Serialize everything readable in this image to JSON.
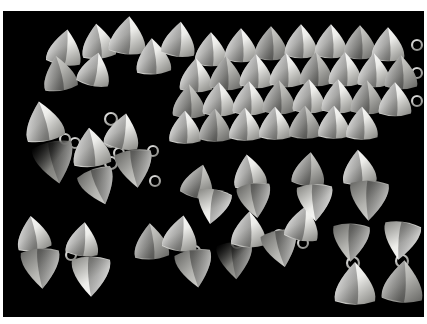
{
  "image": {
    "title": "Triangular metal jewelry components on black background",
    "medium": "photograph",
    "width": 427,
    "height": 324,
    "frame": {
      "border_color": "#ffffff",
      "border_top": 11,
      "border_left": 3,
      "border_right": 3,
      "border_bottom": 7
    },
    "background_color": "#000000",
    "subject": "polished triangular / conical silver-toned metal elements, some joined in pairs and chains by small jump rings",
    "palette": {
      "black": "#000000",
      "white": "#ffffff",
      "highlight": "#f2f2f0",
      "midtone": "#b9b9b5",
      "shadow": "#6e6e6b",
      "deep_shadow": "#3a3a38",
      "ring_metal": "#d8d8d4"
    }
  },
  "chart_data": {
    "type": "scatter",
    "title": "Triangular metal jewelry components on black background",
    "xlabel": "",
    "ylabel": "",
    "xlim": [
      0,
      421
    ],
    "ylim": [
      0,
      306
    ],
    "grid": false,
    "legend": null,
    "note": "Each datum is one triangular/conical metal element: x,y are centroid coordinates inside the black photo area, s is size in px, r is rotation in degrees, t is the tonal group, g is the grouping/cluster it belongs to.",
    "groups": [
      {
        "id": "scatter-top-left",
        "label": "loose scattered cones, upper left"
      },
      {
        "id": "grid-dense",
        "label": "dense packed grid, upper right"
      },
      {
        "id": "chain-left",
        "label": "linked chain, left side"
      },
      {
        "id": "chain-bottom",
        "label": "linked chain, lower middle"
      },
      {
        "id": "pairs-middle",
        "label": "hinged pairs, middle right"
      },
      {
        "id": "pairs-bottom-right",
        "label": "bowtie pairs, lower right"
      },
      {
        "id": "loose-bottom-left",
        "label": "loose pairs, lower left"
      }
    ],
    "points": [
      {
        "x": 62,
        "y": 36,
        "s": 34,
        "r": 8,
        "t": "highlight",
        "g": "scatter-top-left"
      },
      {
        "x": 95,
        "y": 30,
        "s": 33,
        "r": -6,
        "t": "highlight",
        "g": "scatter-top-left"
      },
      {
        "x": 125,
        "y": 24,
        "s": 36,
        "r": 4,
        "t": "highlight",
        "g": "scatter-top-left"
      },
      {
        "x": 56,
        "y": 62,
        "s": 33,
        "r": -10,
        "t": "midtone",
        "g": "scatter-top-left"
      },
      {
        "x": 92,
        "y": 58,
        "s": 32,
        "r": 12,
        "t": "highlight",
        "g": "scatter-top-left"
      },
      {
        "x": 150,
        "y": 45,
        "s": 34,
        "r": -4,
        "t": "highlight",
        "g": "scatter-top-left"
      },
      {
        "x": 176,
        "y": 28,
        "s": 33,
        "r": 6,
        "t": "highlight",
        "g": "scatter-top-left"
      },
      {
        "x": 208,
        "y": 38,
        "s": 32,
        "r": 0,
        "t": "highlight",
        "g": "grid-dense"
      },
      {
        "x": 238,
        "y": 34,
        "s": 32,
        "r": 0,
        "t": "highlight",
        "g": "grid-dense"
      },
      {
        "x": 268,
        "y": 32,
        "s": 32,
        "r": 0,
        "t": "midtone",
        "g": "grid-dense"
      },
      {
        "x": 298,
        "y": 30,
        "s": 32,
        "r": 0,
        "t": "highlight",
        "g": "grid-dense"
      },
      {
        "x": 328,
        "y": 30,
        "s": 32,
        "r": 0,
        "t": "highlight",
        "g": "grid-dense"
      },
      {
        "x": 357,
        "y": 31,
        "s": 32,
        "r": 0,
        "t": "midtone",
        "g": "grid-dense"
      },
      {
        "x": 385,
        "y": 33,
        "s": 32,
        "r": 0,
        "t": "highlight",
        "g": "grid-dense"
      },
      {
        "x": 193,
        "y": 64,
        "s": 32,
        "r": 0,
        "t": "highlight",
        "g": "grid-dense"
      },
      {
        "x": 223,
        "y": 62,
        "s": 32,
        "r": 0,
        "t": "midtone",
        "g": "grid-dense"
      },
      {
        "x": 253,
        "y": 60,
        "s": 32,
        "r": 0,
        "t": "highlight",
        "g": "grid-dense"
      },
      {
        "x": 283,
        "y": 59,
        "s": 32,
        "r": 0,
        "t": "highlight",
        "g": "grid-dense"
      },
      {
        "x": 313,
        "y": 58,
        "s": 32,
        "r": 0,
        "t": "midtone",
        "g": "grid-dense"
      },
      {
        "x": 342,
        "y": 58,
        "s": 32,
        "r": 0,
        "t": "highlight",
        "g": "grid-dense"
      },
      {
        "x": 371,
        "y": 59,
        "s": 32,
        "r": 0,
        "t": "highlight",
        "g": "grid-dense"
      },
      {
        "x": 398,
        "y": 61,
        "s": 32,
        "r": 0,
        "t": "midtone",
        "g": "grid-dense"
      },
      {
        "x": 186,
        "y": 90,
        "s": 32,
        "r": 0,
        "t": "midtone",
        "g": "grid-dense"
      },
      {
        "x": 216,
        "y": 88,
        "s": 32,
        "r": 0,
        "t": "highlight",
        "g": "grid-dense"
      },
      {
        "x": 246,
        "y": 87,
        "s": 32,
        "r": 0,
        "t": "highlight",
        "g": "grid-dense"
      },
      {
        "x": 276,
        "y": 86,
        "s": 32,
        "r": 0,
        "t": "midtone",
        "g": "grid-dense"
      },
      {
        "x": 306,
        "y": 85,
        "s": 32,
        "r": 0,
        "t": "highlight",
        "g": "grid-dense"
      },
      {
        "x": 335,
        "y": 85,
        "s": 32,
        "r": 0,
        "t": "highlight",
        "g": "grid-dense"
      },
      {
        "x": 364,
        "y": 86,
        "s": 32,
        "r": 0,
        "t": "midtone",
        "g": "grid-dense"
      },
      {
        "x": 392,
        "y": 88,
        "s": 32,
        "r": 0,
        "t": "highlight",
        "g": "grid-dense"
      },
      {
        "x": 182,
        "y": 116,
        "s": 31,
        "r": 0,
        "t": "highlight",
        "g": "grid-dense"
      },
      {
        "x": 212,
        "y": 114,
        "s": 31,
        "r": 0,
        "t": "midtone",
        "g": "grid-dense"
      },
      {
        "x": 242,
        "y": 113,
        "s": 31,
        "r": 0,
        "t": "highlight",
        "g": "grid-dense"
      },
      {
        "x": 272,
        "y": 112,
        "s": 31,
        "r": 0,
        "t": "highlight",
        "g": "grid-dense"
      },
      {
        "x": 302,
        "y": 111,
        "s": 31,
        "r": 0,
        "t": "midtone",
        "g": "grid-dense"
      },
      {
        "x": 331,
        "y": 111,
        "s": 31,
        "r": 0,
        "t": "highlight",
        "g": "grid-dense"
      },
      {
        "x": 359,
        "y": 112,
        "s": 31,
        "r": 0,
        "t": "highlight",
        "g": "grid-dense"
      },
      {
        "x": 40,
        "y": 110,
        "s": 38,
        "r": -12,
        "t": "highlight",
        "g": "chain-left"
      },
      {
        "x": 52,
        "y": 152,
        "s": 40,
        "r": 168,
        "t": "shadow",
        "g": "chain-left"
      },
      {
        "x": 88,
        "y": 136,
        "s": 37,
        "r": -6,
        "t": "highlight",
        "g": "chain-left"
      },
      {
        "x": 120,
        "y": 120,
        "s": 34,
        "r": 10,
        "t": "highlight",
        "g": "chain-left"
      },
      {
        "x": 132,
        "y": 158,
        "s": 36,
        "r": 172,
        "t": "midtone",
        "g": "chain-left"
      },
      {
        "x": 96,
        "y": 176,
        "s": 35,
        "r": 160,
        "t": "midtone",
        "g": "chain-left"
      },
      {
        "x": 30,
        "y": 222,
        "s": 33,
        "r": -8,
        "t": "highlight",
        "g": "loose-bottom-left"
      },
      {
        "x": 38,
        "y": 258,
        "s": 38,
        "r": 176,
        "t": "midtone",
        "g": "loose-bottom-left"
      },
      {
        "x": 80,
        "y": 228,
        "s": 32,
        "r": 6,
        "t": "highlight",
        "g": "loose-bottom-left"
      },
      {
        "x": 88,
        "y": 266,
        "s": 38,
        "r": 180,
        "t": "highlight",
        "g": "loose-bottom-left"
      },
      {
        "x": 148,
        "y": 230,
        "s": 34,
        "r": -4,
        "t": "midtone",
        "g": "chain-bottom"
      },
      {
        "x": 178,
        "y": 222,
        "s": 34,
        "r": 8,
        "t": "highlight",
        "g": "chain-bottom"
      },
      {
        "x": 192,
        "y": 258,
        "s": 36,
        "r": 170,
        "t": "midtone",
        "g": "chain-bottom"
      },
      {
        "x": 232,
        "y": 250,
        "s": 35,
        "r": 176,
        "t": "shadow",
        "g": "chain-bottom"
      },
      {
        "x": 246,
        "y": 218,
        "s": 34,
        "r": 2,
        "t": "highlight",
        "g": "chain-bottom"
      },
      {
        "x": 278,
        "y": 238,
        "s": 35,
        "r": 168,
        "t": "midtone",
        "g": "chain-bottom"
      },
      {
        "x": 300,
        "y": 212,
        "s": 33,
        "r": 10,
        "t": "highlight",
        "g": "chain-bottom"
      },
      {
        "x": 196,
        "y": 170,
        "s": 32,
        "r": 14,
        "t": "midtone",
        "g": "pairs-middle"
      },
      {
        "x": 210,
        "y": 196,
        "s": 33,
        "r": 190,
        "t": "highlight",
        "g": "pairs-middle"
      },
      {
        "x": 246,
        "y": 160,
        "s": 32,
        "r": -8,
        "t": "highlight",
        "g": "pairs-middle"
      },
      {
        "x": 252,
        "y": 190,
        "s": 33,
        "r": 172,
        "t": "midtone",
        "g": "pairs-middle"
      },
      {
        "x": 306,
        "y": 158,
        "s": 32,
        "r": 6,
        "t": "midtone",
        "g": "pairs-middle"
      },
      {
        "x": 312,
        "y": 192,
        "s": 35,
        "r": 178,
        "t": "highlight",
        "g": "pairs-middle"
      },
      {
        "x": 356,
        "y": 156,
        "s": 33,
        "r": -4,
        "t": "highlight",
        "g": "pairs-middle"
      },
      {
        "x": 366,
        "y": 190,
        "s": 38,
        "r": 182,
        "t": "midtone",
        "g": "pairs-middle"
      },
      {
        "x": 348,
        "y": 232,
        "s": 36,
        "r": 182,
        "t": "midtone",
        "g": "pairs-bottom-right"
      },
      {
        "x": 352,
        "y": 272,
        "s": 40,
        "r": 0,
        "t": "highlight",
        "g": "pairs-bottom-right"
      },
      {
        "x": 398,
        "y": 230,
        "s": 36,
        "r": 188,
        "t": "highlight",
        "g": "pairs-bottom-right"
      },
      {
        "x": 400,
        "y": 270,
        "s": 40,
        "r": 4,
        "t": "midtone",
        "g": "pairs-bottom-right"
      }
    ],
    "rings": [
      {
        "x": 108,
        "y": 108,
        "r": 6,
        "g": "chain-left"
      },
      {
        "x": 108,
        "y": 130,
        "r": 6,
        "g": "chain-left"
      },
      {
        "x": 108,
        "y": 152,
        "r": 6,
        "g": "chain-left"
      },
      {
        "x": 72,
        "y": 132,
        "r": 5,
        "g": "chain-left"
      },
      {
        "x": 62,
        "y": 128,
        "r": 5,
        "g": "chain-left"
      },
      {
        "x": 116,
        "y": 142,
        "r": 5,
        "g": "chain-left"
      },
      {
        "x": 150,
        "y": 140,
        "r": 5,
        "g": "chain-left"
      },
      {
        "x": 152,
        "y": 170,
        "r": 5,
        "g": "chain-left"
      },
      {
        "x": 68,
        "y": 244,
        "r": 5,
        "g": "loose-bottom-left"
      },
      {
        "x": 192,
        "y": 240,
        "r": 5,
        "g": "chain-bottom"
      },
      {
        "x": 234,
        "y": 232,
        "r": 5,
        "g": "chain-bottom"
      },
      {
        "x": 276,
        "y": 224,
        "r": 5,
        "g": "chain-bottom"
      },
      {
        "x": 300,
        "y": 232,
        "r": 5,
        "g": "chain-bottom"
      },
      {
        "x": 208,
        "y": 184,
        "r": 5,
        "g": "pairs-middle"
      },
      {
        "x": 250,
        "y": 176,
        "r": 5,
        "g": "pairs-middle"
      },
      {
        "x": 310,
        "y": 176,
        "r": 5,
        "g": "pairs-middle"
      },
      {
        "x": 360,
        "y": 172,
        "r": 5,
        "g": "pairs-middle"
      },
      {
        "x": 350,
        "y": 252,
        "r": 6,
        "g": "pairs-bottom-right"
      },
      {
        "x": 399,
        "y": 250,
        "r": 6,
        "g": "pairs-bottom-right"
      },
      {
        "x": 414,
        "y": 34,
        "r": 5,
        "g": "grid-dense"
      },
      {
        "x": 414,
        "y": 62,
        "r": 5,
        "g": "grid-dense"
      },
      {
        "x": 414,
        "y": 90,
        "r": 5,
        "g": "grid-dense"
      }
    ]
  }
}
